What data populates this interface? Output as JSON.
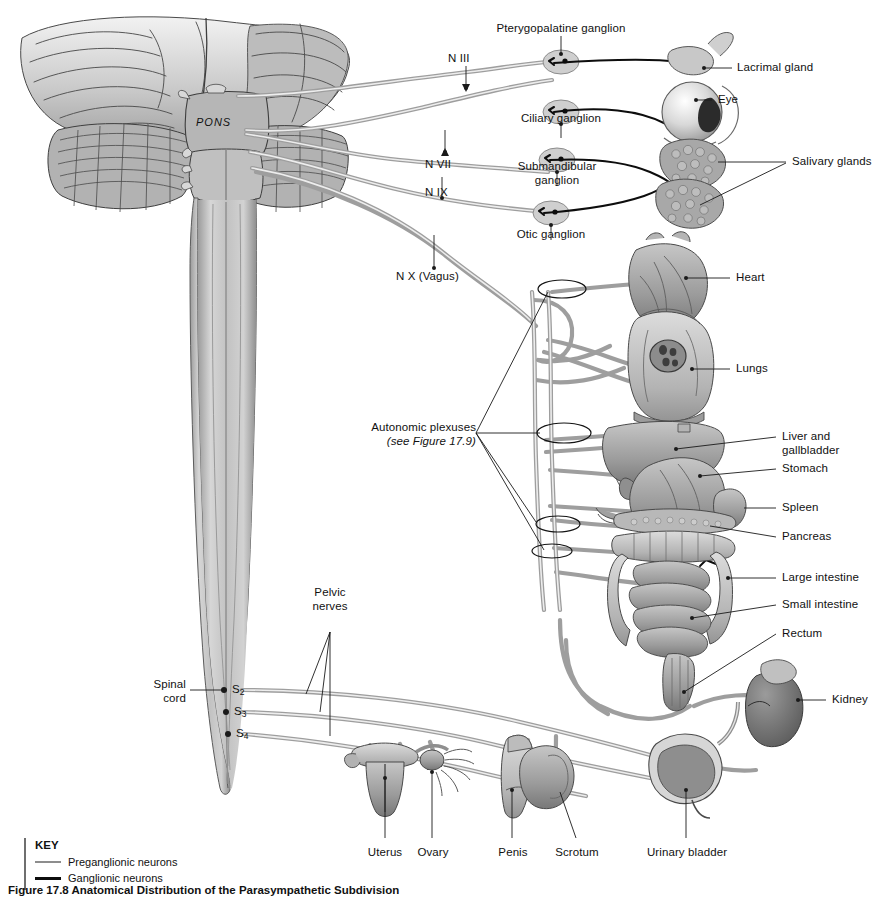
{
  "figure": {
    "caption": "Figure 17.8  Anatomical Distribution of the Parasympathetic Subdivision",
    "brain_label": "PONS",
    "spinal_cord_label_line1": "Spinal",
    "spinal_cord_label_line2": "cord",
    "pelvic_nerves_line1": "Pelvic",
    "pelvic_nerves_line2": "nerves",
    "plexuses_label": "Autonomic plexuses",
    "plexuses_note": "(see Figure 17.9)"
  },
  "key": {
    "title": "KEY",
    "items": [
      {
        "label": "Preganglionic neurons",
        "style": "thin-gray",
        "color": "#8d8d8d"
      },
      {
        "label": "Ganglionic neurons",
        "style": "thick-black",
        "color": "#0d0d0d"
      }
    ]
  },
  "cranial_nerves": [
    {
      "id": "n3",
      "label": "N III"
    },
    {
      "id": "n7",
      "label": "N VII"
    },
    {
      "id": "n9",
      "label": "N IX"
    },
    {
      "id": "n10",
      "label": "N X (Vagus)"
    }
  ],
  "ganglia": [
    {
      "id": "pterygopalatine",
      "label": "Pterygopalatine ganglion"
    },
    {
      "id": "ciliary",
      "label": "Ciliary ganglion"
    },
    {
      "id": "submandibular",
      "label": "Submandibular\nganglion",
      "line1": "Submandibular",
      "line2": "ganglion"
    },
    {
      "id": "otic",
      "label": "Otic ganglion"
    }
  ],
  "spinal_segments": [
    {
      "id": "s2",
      "letter": "S",
      "number": "2"
    },
    {
      "id": "s3",
      "letter": "S",
      "number": "3"
    },
    {
      "id": "s4",
      "letter": "S",
      "number": "4"
    }
  ],
  "organs_right": [
    {
      "id": "lacrimal-gland",
      "label": "Lacrimal gland"
    },
    {
      "id": "eye",
      "label": "Eye"
    },
    {
      "id": "salivary-glands",
      "label": "Salivary glands"
    },
    {
      "id": "heart",
      "label": "Heart"
    },
    {
      "id": "lungs",
      "label": "Lungs"
    },
    {
      "id": "liver",
      "label": "Liver and",
      "line2": "gallbladder"
    },
    {
      "id": "stomach",
      "label": "Stomach"
    },
    {
      "id": "spleen",
      "label": "Spleen"
    },
    {
      "id": "pancreas",
      "label": "Pancreas"
    },
    {
      "id": "large-intestine",
      "label": "Large intestine"
    },
    {
      "id": "small-intestine",
      "label": "Small intestine"
    },
    {
      "id": "rectum",
      "label": "Rectum"
    },
    {
      "id": "kidney",
      "label": "Kidney"
    }
  ],
  "organs_bottom": [
    {
      "id": "uterus",
      "label": "Uterus"
    },
    {
      "id": "ovary",
      "label": "Ovary"
    },
    {
      "id": "penis",
      "label": "Penis"
    },
    {
      "id": "scrotum",
      "label": "Scrotum"
    },
    {
      "id": "urinary-bladder",
      "label": "Urinary bladder"
    }
  ],
  "colors": {
    "background": "#ffffff",
    "text": "#111111",
    "preganglionic": "#8d8d8d",
    "ganglionic": "#0d0d0d",
    "leader_line": "#1a1a1a",
    "tissue_light": "#d2d2d2",
    "tissue_mid": "#a9a9a9",
    "tissue_dark": "#7c7c7c",
    "tissue_deep": "#5c5c5c",
    "outline": "#3a3a3a"
  }
}
